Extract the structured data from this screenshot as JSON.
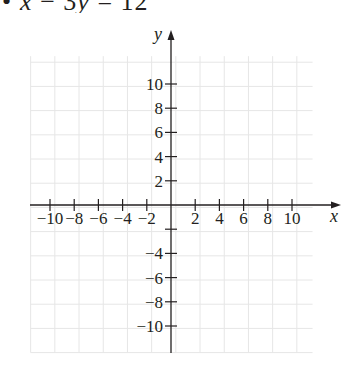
{
  "problem": {
    "bullet": "•",
    "equation": "x − 3y = 12",
    "equation_parts": [
      "x",
      " − 3",
      "y",
      " = 12"
    ]
  },
  "chart_data": {
    "type": "scatter",
    "title": "",
    "xlabel": "x",
    "ylabel": "y",
    "xlim": [
      -12,
      12
    ],
    "ylim": [
      -12,
      12
    ],
    "grid": true,
    "grid_step": 2,
    "x_ticks": [
      -10,
      -8,
      -6,
      -4,
      -2,
      2,
      4,
      6,
      8,
      10
    ],
    "x_tick_labels": [
      "−10",
      "−8",
      "−6",
      "−4",
      "−2",
      "2",
      "4",
      "6",
      "8",
      "10"
    ],
    "y_ticks": [
      10,
      8,
      6,
      4,
      2,
      -2,
      -4,
      -6,
      -8,
      -10
    ],
    "y_tick_labels": [
      "10",
      "8",
      "6",
      "4",
      "2",
      "",
      "−4",
      "−6",
      "−8",
      "−10"
    ],
    "series": []
  },
  "colors": {
    "axis": "#231f20",
    "grid": "#e6e6e6",
    "background": "#ffffff"
  }
}
